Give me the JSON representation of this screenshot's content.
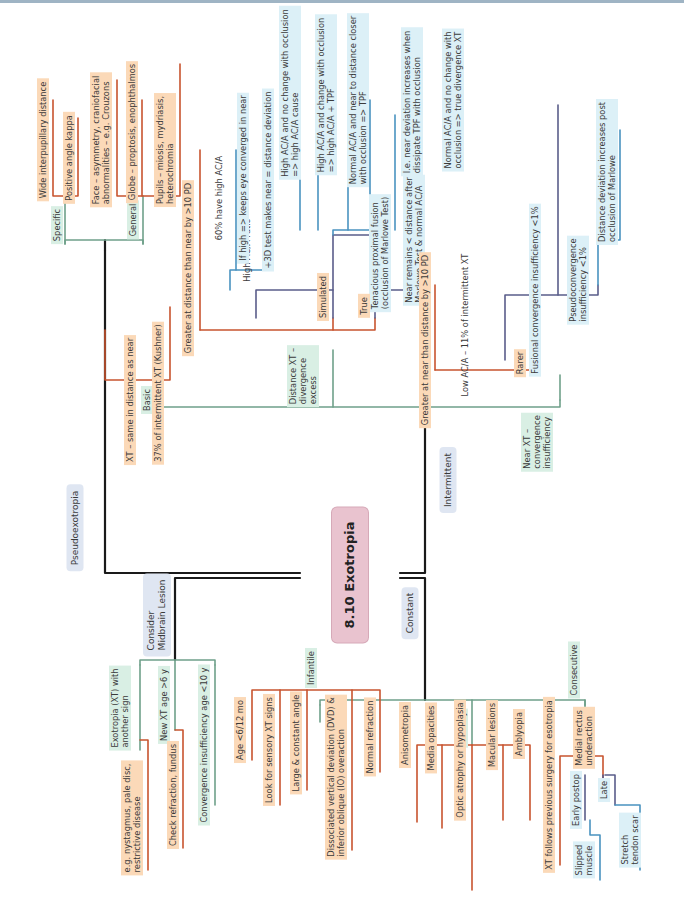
{
  "diagram": {
    "title": "8.10 Exotropia",
    "colors": {
      "main_line": "#1a1a1a",
      "green_line": "#6fa08a",
      "orange_line": "#c8542f",
      "purple_line": "#5a5d8a",
      "blue_line": "#4a93c0",
      "orange_fill": "#fbd9b8",
      "blue_fill": "#dcf0f7",
      "green_fill": "#d9efe4",
      "box_fill": "#dfe6f2",
      "root_fill": "#e9c3cf"
    },
    "branches": {
      "pseudoexotropia": {
        "label": "Pseudoexotropia",
        "specific": {
          "label": "Specific",
          "items": [
            "Wide interpupillary distance",
            "Positive angle kappa"
          ]
        },
        "general": {
          "label": "General",
          "items": [
            "Face – asymmetry, craniofacial\nabnormalities – e.g. Crouzons",
            "Globe – proptosis, enophthalmos",
            "Pupils – miosis, mydriasis,\nheterochromia"
          ]
        }
      },
      "intermittent": {
        "label": "Intermittent",
        "basic": {
          "label": "Basic",
          "items": [
            "XT – same in distance as near",
            "37% of intermittent XT (Kushner)"
          ]
        },
        "distance": {
          "label": "Distance XT –\ndivergence\nexcess",
          "greater": "Greater at distance than near by >10 PD",
          "simulated": {
            "label": "Simulated",
            "high_aca": {
              "label": "High AC/A ratio",
              "items": [
                "60% have high AC/A",
                "If high => keeps eye converged in near",
                "+3D test makes near = distance deviation"
              ]
            },
            "tenacious": {
              "label": "Tenacious proximal fusion\n(occlusion of Marlowe Test)",
              "items": [
                "High AC/A and no change with occlusion\n=> high AC/A cause",
                "High AC/A and change with occlusion\n=> high AC/A + TPF",
                "Normal AC/A and near to distance closer\nwith occlusion => TPF",
                "I.e. near deviation increases when\ndissipate TPF with occlusion",
                "Normal AC/A and no change with\nocclusion => true divergence XT"
              ]
            }
          },
          "true": {
            "label": "True",
            "items": [
              "Near remains < distance after\nMarlowe Test & normal AC/A"
            ]
          }
        },
        "near": {
          "label": "Near XT –\nconvergence\ninsufficiency",
          "greater": "Greater at near than distance by >10 PD",
          "rarer": {
            "label": "Rarer",
            "items": [
              "Low AC/A – 11% of intermittent XT",
              "Fusional convergence insufficiency <1%",
              "Pseudoconvergence\ninsufficiency <1%",
              "Distance deviation increases post\nocclusion of Marlowe"
            ]
          }
        }
      },
      "midbrain": {
        "label": "Consider\nMidbrain Lesion",
        "items": {
          "another_sign": "Exotropia (XT) with\nanother sign",
          "another_sign_eg": "e.g. nystagmus, pale disc,\nrestrictive disease",
          "new_xt": "New XT age >6 y",
          "check": "Check refraction, fundus",
          "ci": "Convergence insufficiency age <10 y"
        }
      },
      "constant": {
        "label": "Constant",
        "infantile": {
          "label": "Infantile",
          "items": [
            "Age <6/12 mo",
            "Look for sensory XT signs",
            "Large & constant angle",
            "Dissociated vertical deviation (DVD) &\ninferior oblique (IO) overaction",
            "Normal refraction"
          ]
        },
        "sensory": {
          "label": "Sensory",
          "items": [
            "Anisometropia",
            "Media opacities",
            "Optic atrophy or hypoplasia",
            "Macular lesions",
            "Amblyopia"
          ]
        },
        "consecutive": {
          "label": "Consecutive",
          "items": {
            "follows": "XT follows previous surgery for esotropia",
            "mr": "Medial rectus\nunderaction",
            "early": "Early postop",
            "slipped": "Slipped\nmuscle",
            "late": "Late",
            "stretch": "Stretch\ntendon scar"
          }
        }
      }
    }
  }
}
